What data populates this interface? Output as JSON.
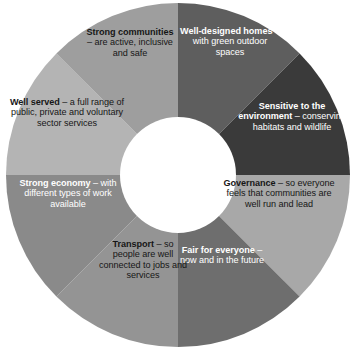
{
  "figure": {
    "type": "donut-diagram"
  },
  "chart_data": {
    "type": "pie",
    "title": "",
    "subtitle": "",
    "xlabel": "",
    "ylabel": "",
    "legend_position": "none",
    "grid": false,
    "donut": true,
    "inner_radius_ratio": 0.34,
    "start_angle_deg": -90,
    "direction": "clockwise",
    "categories": [
      "Well-designed homes",
      "Sensitive to the environment",
      "Governance",
      "Fair for everyone",
      "Transport",
      "Strong economy",
      "Well served",
      "Strong communities"
    ],
    "values": [
      12.5,
      12.5,
      12.5,
      12.5,
      12.5,
      12.5,
      12.5,
      12.5
    ],
    "colors": [
      "#5e5e5e",
      "#3a3a3a",
      "#a8a8a8",
      "#6e6e6e",
      "#949494",
      "#8a8a8a",
      "#b4b4b4",
      "#9e9e9e"
    ]
  },
  "segments": [
    {
      "id": "well-designed-homes",
      "heading": "Well-designed homes",
      "detail": " – with green outdoor spaces",
      "color": "#5e5e5e",
      "text_color": "#ffffff",
      "start_deg": -90,
      "end_deg": -45
    },
    {
      "id": "sensitive-environment",
      "heading": "Sensitive to the environment",
      "detail": " – conserving habitats and wildlife",
      "color": "#3a3a3a",
      "text_color": "#ffffff",
      "start_deg": -45,
      "end_deg": 0
    },
    {
      "id": "governance",
      "heading": "Governance",
      "detail": " – so everyone feels that communities are well run and lead",
      "color": "#a8a8a8",
      "text_color": "#161616",
      "start_deg": 0,
      "end_deg": 45
    },
    {
      "id": "fair-for-everyone",
      "heading": "Fair for everyone",
      "detail": " – now and in the future",
      "color": "#6e6e6e",
      "text_color": "#ffffff",
      "start_deg": 45,
      "end_deg": 90
    },
    {
      "id": "transport",
      "heading": "Transport",
      "detail": " – so people are well connected to jobs and services",
      "color": "#949494",
      "text_color": "#161616",
      "start_deg": 90,
      "end_deg": 135
    },
    {
      "id": "strong-economy",
      "heading": "Strong economy",
      "detail": " – with different types of work available",
      "color": "#8a8a8a",
      "text_color": "#ffffff",
      "start_deg": 135,
      "end_deg": 180
    },
    {
      "id": "well-served",
      "heading": "Well served",
      "detail": " – a full range of public, private and voluntary sector services",
      "color": "#b4b4b4",
      "text_color": "#161616",
      "start_deg": 180,
      "end_deg": 225
    },
    {
      "id": "strong-communities",
      "heading": "Strong communities",
      "detail": " – are active, inclusive and safe",
      "color": "#9e9e9e",
      "text_color": "#161616",
      "start_deg": 225,
      "end_deg": 270
    }
  ]
}
